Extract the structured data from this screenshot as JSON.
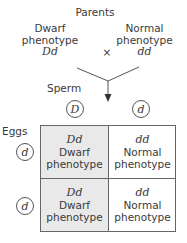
{
  "title": "Parents",
  "parents": [
    {
      "phenotype": "Dwarf\nphenotype",
      "phenotype_line1": "Dwarf",
      "phenotype_line2": "phenotype",
      "genotype": "Dd"
    },
    {
      "phenotype_line1": "Normal",
      "phenotype_line2": "phenotype",
      "genotype": "dd"
    }
  ],
  "cross_symbol": "×",
  "sperm_label": "Sperm",
  "sperm": [
    "D",
    "d"
  ],
  "eggs_label": "Eggs",
  "eggs": [
    "d",
    "d"
  ],
  "grid": [
    [
      {
        "genotype": "Dd",
        "line1": "Dwarf",
        "line2": "phenotype",
        "shaded": true
      },
      {
        "genotype": "dd",
        "line1": "Normal",
        "line2": "phenotype",
        "shaded": false
      }
    ],
    [
      {
        "genotype": "Dd",
        "line1": "Dwarf",
        "line2": "phenotype",
        "shaded": true
      },
      {
        "genotype": "dd",
        "line1": "Normal",
        "line2": "phenotype",
        "shaded": false
      }
    ]
  ],
  "colors": {
    "shaded_cell": "#e9e9e9",
    "line": "#555555",
    "text": "#3a3a3a"
  }
}
